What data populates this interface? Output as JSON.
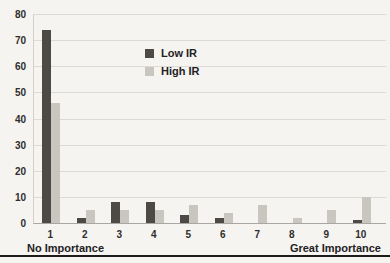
{
  "chart_data": {
    "type": "bar",
    "categories": [
      "1",
      "2",
      "3",
      "4",
      "5",
      "6",
      "7",
      "8",
      "9",
      "10"
    ],
    "series": [
      {
        "name": "Low IR",
        "color": "#4d4a46",
        "values": [
          74,
          2,
          8,
          8,
          3,
          2,
          0,
          0,
          0,
          1
        ]
      },
      {
        "name": "High IR",
        "color": "#c9c6c0",
        "values": [
          46,
          5,
          5,
          5,
          7,
          4,
          7,
          2,
          5,
          10
        ]
      }
    ],
    "title": "",
    "xlabel_left": "No Importance",
    "xlabel_right": "Great Importance",
    "ylabel": "",
    "ylim": [
      0,
      80
    ],
    "yticks": [
      0,
      10,
      20,
      30,
      40,
      50,
      60,
      70,
      80
    ],
    "grid": true,
    "legend_position": "upper-center"
  },
  "colors": {
    "background": "#f5f4f1",
    "gridline": "#dcdad6",
    "axis_line": "#a9a7a3",
    "text": "#2f2e2c",
    "bottom_rule": "#1c1b19"
  }
}
